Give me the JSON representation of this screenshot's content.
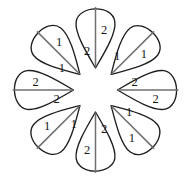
{
  "figure": {
    "background_color": "#ffffff",
    "outline_color": "#1f1f1f",
    "divider_color": "#6f6f6f",
    "digit_color": "#171717",
    "petal_count": 8,
    "center": {
      "x": 95.5,
      "y": 90
    }
  },
  "petals": [
    {
      "id": "petal-top",
      "position": "top",
      "angle_deg": 270,
      "divider": "vertical",
      "tip": "down",
      "parts": [
        {
          "slot": "left",
          "label": "2"
        },
        {
          "slot": "right",
          "label": "2"
        }
      ]
    },
    {
      "id": "petal-top-right",
      "position": "top-right",
      "angle_deg": 315,
      "divider": "diagonal",
      "tip": "down-left",
      "parts": [
        {
          "slot": "upper-left",
          "label": "1"
        },
        {
          "slot": "lower-right",
          "label": "1"
        }
      ]
    },
    {
      "id": "petal-right",
      "position": "right",
      "angle_deg": 0,
      "divider": "horizontal",
      "tip": "left",
      "parts": [
        {
          "slot": "upper",
          "label": "2"
        },
        {
          "slot": "lower",
          "label": "2"
        }
      ]
    },
    {
      "id": "petal-bottom-right",
      "position": "bottom-right",
      "angle_deg": 45,
      "divider": "diagonal",
      "tip": "up-left",
      "parts": [
        {
          "slot": "upper-right",
          "label": "1"
        },
        {
          "slot": "lower-left",
          "label": "1"
        }
      ]
    },
    {
      "id": "petal-bottom",
      "position": "bottom",
      "angle_deg": 90,
      "divider": "vertical",
      "tip": "up",
      "parts": [
        {
          "slot": "left",
          "label": "2"
        },
        {
          "slot": "right",
          "label": "2"
        }
      ]
    },
    {
      "id": "petal-bottom-left",
      "position": "bottom-left",
      "angle_deg": 135,
      "divider": "diagonal",
      "tip": "up-right",
      "parts": [
        {
          "slot": "upper-left",
          "label": "1"
        },
        {
          "slot": "lower-right",
          "label": "1"
        }
      ]
    },
    {
      "id": "petal-left",
      "position": "left",
      "angle_deg": 180,
      "divider": "horizontal",
      "tip": "right",
      "parts": [
        {
          "slot": "upper",
          "label": "2"
        },
        {
          "slot": "lower",
          "label": "2"
        }
      ]
    },
    {
      "id": "petal-top-left",
      "position": "top-left",
      "angle_deg": 225,
      "divider": "diagonal",
      "tip": "down-right",
      "parts": [
        {
          "slot": "upper-right",
          "label": "1"
        },
        {
          "slot": "lower-left",
          "label": "1"
        }
      ]
    }
  ],
  "geometry": {
    "tip_radius": 22,
    "petal_length": 58,
    "petal_half_width": 21,
    "digit_offset_near": 17,
    "digit_offset_far": 38,
    "digit_cross_offset": 8.5
  }
}
